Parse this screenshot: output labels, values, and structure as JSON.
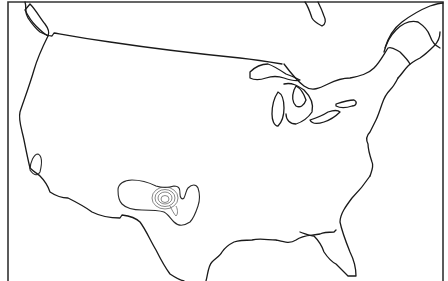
{
  "map": {
    "title": "",
    "region": "Contiguous United States",
    "colors": {
      "background": "#ffffff",
      "coastline": "#1a1a1a",
      "contour": "#2a2a2a",
      "frame": "#333333"
    },
    "features": [
      {
        "name": "coastline-outline",
        "type": "line"
      },
      {
        "name": "great-lakes",
        "type": "line"
      },
      {
        "name": "contour-texas-oklahoma",
        "type": "contour",
        "levels": 5
      },
      {
        "name": "contour-southern-california",
        "type": "contour",
        "levels": 1
      }
    ]
  }
}
